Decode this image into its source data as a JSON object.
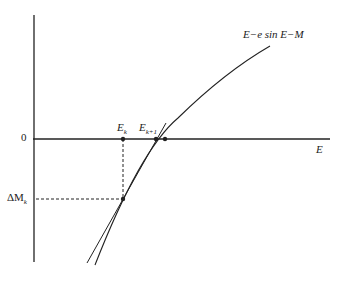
{
  "diagram": {
    "curve_label": "E−e sin E−M",
    "x_axis_label": "E",
    "y_tick_zero": "0",
    "y_tick_delta": "ΔM",
    "y_tick_delta_sub": "k",
    "point_Ek": "E",
    "point_Ek_sub": "k",
    "point_Ek1": "E",
    "point_Ek1_sub": "k+1",
    "colors": {
      "line": "#222222",
      "background": "#ffffff"
    }
  }
}
